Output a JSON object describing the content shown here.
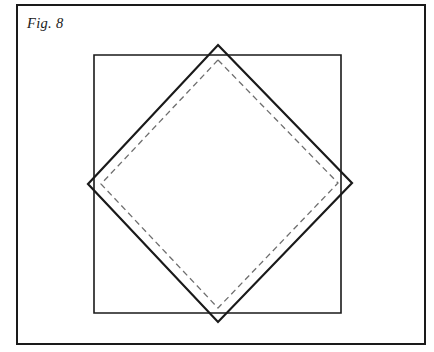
{
  "figure": {
    "caption": "Fig. 8",
    "background_color": "#ffffff",
    "ink_color": "#1a1a1a",
    "dashed_color": "#6e6e6e",
    "border": {
      "name": "figure-border-frame",
      "x": 17,
      "y": 5,
      "width": 408,
      "height": 339,
      "stroke_width": 2.0
    },
    "shapes": [
      {
        "name": "inner-square",
        "type": "square",
        "stroke": "solid",
        "stroke_width": 1.6,
        "points": "94,55 341,55 341,313 94,313"
      },
      {
        "name": "rotated-diamond-solid",
        "type": "diamond",
        "stroke": "solid",
        "stroke_width": 2.2,
        "points": "218,45 352,183 218,322 88,184"
      },
      {
        "name": "rotated-diamond-dashed-inset",
        "type": "diamond",
        "stroke": "dashed",
        "stroke_width": 1.3,
        "dash_pattern": "6 4",
        "points": "218,60 338,183 218,308 101,184"
      }
    ]
  }
}
